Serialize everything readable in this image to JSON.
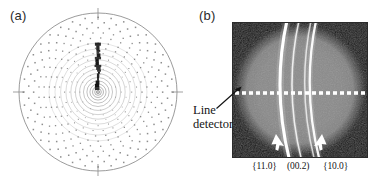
{
  "figure": {
    "caption_panels": [
      {
        "id": "a",
        "label": "(a)"
      },
      {
        "id": "b",
        "label": "(b)"
      }
    ]
  },
  "panel_a": {
    "label": "(a)",
    "description": "simulated polar reciprocal-space dot pattern with concentric rings and central dark streak",
    "colors": {
      "dot": "#6e6e6e",
      "ring": "#808080",
      "streak": "#0d0d0d",
      "outline": "#8c8c8c",
      "tick": "#b0b0b0",
      "background": "#ffffff"
    },
    "geometry": {
      "center_x": 88,
      "center_y": 86,
      "outer_radius": 79,
      "ring_count": 14,
      "radial_spokes": 36,
      "dot_rows": 13
    }
  },
  "panel_b": {
    "label": "(b)",
    "description": "grayscale area-detector diffraction image with bright Debye-Scherrer arcs",
    "line_detector": {
      "label_line_1": "Line",
      "label_line_2": "detector",
      "trace_y": 71,
      "dash_count": 19,
      "dash_color": "#ffffff"
    },
    "miller_labels": [
      {
        "text": "{11.0}",
        "arc_index": 0
      },
      {
        "text": "(00.2)",
        "arc_index": 1
      },
      {
        "text": "{10.0}",
        "arc_index": 2
      }
    ],
    "arrows": [
      {
        "points_to": "{11.0}",
        "x": 42,
        "y": 118
      },
      {
        "points_to": "{10.0}",
        "x": 88,
        "y": 118
      }
    ],
    "colors": {
      "background_gray": "#8a8a8a",
      "vignette_dark": "#121212",
      "arc_bright": "#ffffff",
      "arc_soft": "#d8d8d8",
      "frame": "#2a2a2a"
    },
    "arcs": [
      {
        "name": "{11.0}",
        "x_top": 56,
        "x_mid": 45,
        "x_bot": 58,
        "width": 3.1,
        "brightness": 1.0
      },
      {
        "name": "(00.2)",
        "x_top": 68,
        "x_mid": 57,
        "x_bot": 70,
        "width": 1.6,
        "brightness": 0.82
      },
      {
        "name": "{10.0}-inner",
        "x_top": 80,
        "x_mid": 70,
        "x_bot": 83,
        "width": 1.5,
        "brightness": 0.72
      },
      {
        "name": "{10.0}",
        "x_top": 85,
        "x_mid": 75,
        "x_bot": 88,
        "width": 2.3,
        "brightness": 0.95
      }
    ]
  }
}
